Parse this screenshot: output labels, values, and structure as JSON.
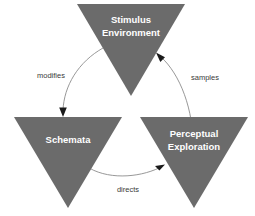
{
  "diagram": {
    "background_color": "#ffffff",
    "node_fill_color": "#6b6b6b",
    "node_text_color": "#ffffff",
    "edge_color": "#8c8c8c",
    "edge_label_color": "#3a3a3a",
    "arrow_head_color": "#1a1a1a",
    "nodes": [
      {
        "id": "stimulus-environment",
        "shape": "downward-triangle",
        "line1": "Stimulus",
        "line2": "Environment",
        "position": "top"
      },
      {
        "id": "schemata",
        "shape": "downward-triangle",
        "line1": "Schemata",
        "line2": "",
        "position": "bottom-left"
      },
      {
        "id": "perceptual-exploration",
        "shape": "downward-triangle",
        "line1": "Perceptual",
        "line2": "Exploration",
        "position": "bottom-right"
      }
    ],
    "edges": [
      {
        "id": "modifies",
        "label": "modifies",
        "from": "stimulus-environment",
        "to": "schemata",
        "side": "left"
      },
      {
        "id": "directs",
        "label": "directs",
        "from": "schemata",
        "to": "perceptual-exploration",
        "side": "bottom"
      },
      {
        "id": "samples",
        "label": "samples",
        "from": "perceptual-exploration",
        "to": "stimulus-environment",
        "side": "right"
      }
    ]
  }
}
